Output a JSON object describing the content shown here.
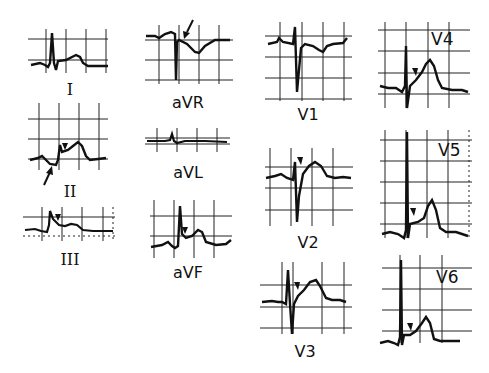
{
  "figure": {
    "type": "12-lead ECG diagram",
    "background": "#ffffff",
    "ink_color": "#111111",
    "leads": [
      {
        "id": "I",
        "label": "I",
        "marker": "none"
      },
      {
        "id": "II",
        "label": "II",
        "marker": "arrowhead + arrow"
      },
      {
        "id": "III",
        "label": "III",
        "marker": "arrowhead"
      },
      {
        "id": "aVR",
        "label": "aVR",
        "marker": "arrow"
      },
      {
        "id": "aVL",
        "label": "aVL",
        "marker": "none"
      },
      {
        "id": "aVF",
        "label": "aVF",
        "marker": "arrowhead"
      },
      {
        "id": "V1",
        "label": "V1",
        "marker": "none"
      },
      {
        "id": "V2",
        "label": "V2",
        "marker": "arrowhead"
      },
      {
        "id": "V3",
        "label": "V3",
        "marker": "arrowhead"
      },
      {
        "id": "V4",
        "label": "V4",
        "marker": "arrowhead"
      },
      {
        "id": "V5",
        "label": "V5",
        "marker": "arrowhead"
      },
      {
        "id": "V6",
        "label": "V6",
        "marker": "arrowhead"
      }
    ]
  }
}
